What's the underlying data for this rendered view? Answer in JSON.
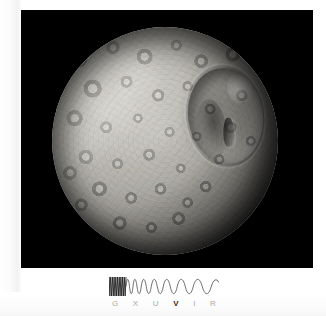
{
  "photo": {
    "subject": "Mimas",
    "alt": "Grayscale image of Saturn's moon Mimas showing the large Herschel impact crater with its central peak on the right side of the heavily cratered disc",
    "background_color": "#000000",
    "frame": {
      "x": 21,
      "y": 10,
      "width": 292,
      "height": 258
    },
    "disc": {
      "x": 52,
      "y": 27,
      "width": 226,
      "height": 228
    },
    "features": [
      {
        "name": "herschel-crater",
        "description": "large impact crater with central peak"
      },
      {
        "name": "terminator",
        "description": "shadowed limb on the lower-right"
      }
    ]
  },
  "spectrum": {
    "label": "electromagnetic-spectrum-indicator",
    "active_band": "V",
    "wave_color": "#4a4a4a",
    "label_color": "#a8a8a8",
    "active_label_color": "#303030",
    "bands": [
      {
        "code": "G",
        "name": "Gamma ray",
        "active": false
      },
      {
        "code": "X",
        "name": "X-ray",
        "active": false
      },
      {
        "code": "U",
        "name": "Ultraviolet",
        "active": false
      },
      {
        "code": "V",
        "name": "Visible",
        "active": true
      },
      {
        "code": "I",
        "name": "Infrared",
        "active": false
      },
      {
        "code": "R",
        "name": "Radio",
        "active": false
      }
    ]
  },
  "page": {
    "background_color": "#ffffff"
  }
}
